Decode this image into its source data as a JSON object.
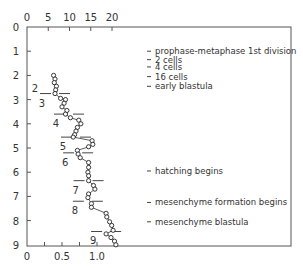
{
  "chart_data": {
    "type": "line",
    "title": "",
    "xlabel": "",
    "ylabel": "",
    "x_axis_bottom": {
      "ticks": [
        0,
        0.5,
        1.0
      ],
      "tick_labels": [
        "0",
        "0.5",
        "1.0"
      ],
      "minor_ticks": [
        0.25,
        0.75
      ],
      "range": [
        0,
        1.4
      ]
    },
    "x_axis_top": {
      "ticks": [
        0,
        5,
        10,
        15,
        20
      ],
      "tick_labels": [
        "0",
        "5",
        "10",
        "15",
        "20"
      ]
    },
    "y_axis": {
      "ticks": [
        0,
        1,
        2,
        3,
        4,
        5,
        6,
        7,
        8,
        9
      ],
      "tick_labels": [
        "0",
        "1",
        "2",
        "3",
        "4",
        "5",
        "6",
        "7",
        "8",
        "9"
      ],
      "range": [
        0,
        9
      ],
      "inverted": true
    },
    "grid": false,
    "series": [
      {
        "name": "measurement",
        "marker": "open-circle",
        "points": [
          {
            "x": 0.38,
            "y": 2.0
          },
          {
            "x": 0.4,
            "y": 2.15
          },
          {
            "x": 0.39,
            "y": 2.3
          },
          {
            "x": 0.42,
            "y": 2.45
          },
          {
            "x": 0.41,
            "y": 2.6
          },
          {
            "x": 0.4,
            "y": 2.75
          },
          {
            "x": 0.48,
            "y": 2.95
          },
          {
            "x": 0.55,
            "y": 3.0
          },
          {
            "x": 0.53,
            "y": 3.15
          },
          {
            "x": 0.5,
            "y": 3.3
          },
          {
            "x": 0.57,
            "y": 3.45
          },
          {
            "x": 0.55,
            "y": 3.6
          },
          {
            "x": 0.62,
            "y": 3.75
          },
          {
            "x": 0.74,
            "y": 3.85
          },
          {
            "x": 0.77,
            "y": 4.0
          },
          {
            "x": 0.72,
            "y": 4.15
          },
          {
            "x": 0.7,
            "y": 4.3
          },
          {
            "x": 0.68,
            "y": 4.45
          },
          {
            "x": 0.66,
            "y": 4.55
          },
          {
            "x": 0.93,
            "y": 4.7
          },
          {
            "x": 0.94,
            "y": 4.85
          },
          {
            "x": 0.88,
            "y": 4.95
          },
          {
            "x": 0.72,
            "y": 5.1
          },
          {
            "x": 0.73,
            "y": 5.25
          },
          {
            "x": 0.76,
            "y": 5.4
          },
          {
            "x": 0.88,
            "y": 5.6
          },
          {
            "x": 0.88,
            "y": 5.8
          },
          {
            "x": 0.87,
            "y": 6.0
          },
          {
            "x": 0.88,
            "y": 6.15
          },
          {
            "x": 0.88,
            "y": 6.35
          },
          {
            "x": 0.95,
            "y": 6.55
          },
          {
            "x": 0.97,
            "y": 6.7
          },
          {
            "x": 0.88,
            "y": 6.9
          },
          {
            "x": 0.87,
            "y": 7.05
          },
          {
            "x": 0.92,
            "y": 7.3
          },
          {
            "x": 0.92,
            "y": 7.45
          },
          {
            "x": 1.13,
            "y": 7.7
          },
          {
            "x": 1.14,
            "y": 7.85
          },
          {
            "x": 1.18,
            "y": 8.05
          },
          {
            "x": 1.21,
            "y": 8.2
          },
          {
            "x": 1.23,
            "y": 8.4
          },
          {
            "x": 1.13,
            "y": 8.55
          },
          {
            "x": 1.2,
            "y": 8.7
          },
          {
            "x": 1.25,
            "y": 8.85
          },
          {
            "x": 1.27,
            "y": 9.0
          }
        ]
      }
    ],
    "stage_dividers": [
      {
        "y": 2.75,
        "x_center": 0.4,
        "label_above": "2",
        "label_below": "3"
      },
      {
        "y": 3.6,
        "x_center": 0.6,
        "label_below": "4"
      },
      {
        "y": 4.55,
        "x_center": 0.7,
        "label_below": "5"
      },
      {
        "y": 5.2,
        "x_center": 0.73,
        "label_below": "6"
      },
      {
        "y": 6.35,
        "x_center": 0.88,
        "label_below": "7"
      },
      {
        "y": 7.2,
        "x_center": 0.87,
        "label_below": "8"
      },
      {
        "y": 8.45,
        "x_center": 1.13,
        "label_below": "9"
      }
    ],
    "annotations": [
      {
        "y": 1.0,
        "text": "prophase-metaphase 1st division"
      },
      {
        "y": 1.35,
        "text": "2 cells"
      },
      {
        "y": 1.65,
        "text": "4 cells"
      },
      {
        "y": 2.05,
        "text": "16 cells"
      },
      {
        "y": 2.45,
        "text": "early blastula"
      },
      {
        "y": 5.95,
        "text": "hatching begins"
      },
      {
        "y": 7.25,
        "text": "mesenchyme formation begins"
      },
      {
        "y": 8.05,
        "text": "mesenchyme blastula"
      }
    ]
  }
}
